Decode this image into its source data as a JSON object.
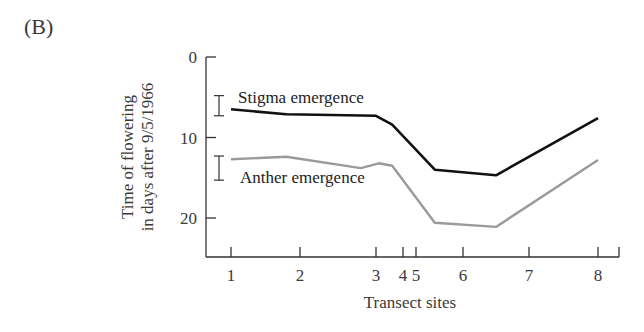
{
  "panel_label": "(B)",
  "chart_data": {
    "type": "line",
    "title": "",
    "xlabel": "Transect sites",
    "ylabel": "Time of flowering in days after 9/5/1966",
    "ylabel_lines": [
      "Time of flowering",
      "in days after 9/5/1966"
    ],
    "y_inverted": true,
    "ylim": [
      0,
      25
    ],
    "yticks": [
      0,
      10,
      20
    ],
    "xticks": [
      1,
      2,
      3,
      4,
      5,
      6,
      7,
      8
    ],
    "xtick_labels": [
      "1",
      "2",
      "3",
      "4",
      "5",
      "6",
      "7",
      "8"
    ],
    "grid": false,
    "legend": "inline labels",
    "series": [
      {
        "name": "Stigma emergence",
        "color": "#111111",
        "x": [
          1.0,
          1.8,
          3.0,
          3.6,
          5.4,
          6.5,
          8.0
        ],
        "values": [
          6.5,
          7.1,
          7.3,
          8.4,
          14.0,
          14.7,
          7.6
        ],
        "error_bar": {
          "center": 6.7,
          "low": 4.8,
          "high": 7.3
        }
      },
      {
        "name": "Anther emergence",
        "color": "#9a9a9a",
        "x": [
          1.0,
          1.8,
          2.8,
          3.1,
          3.6,
          5.4,
          6.5,
          8.0
        ],
        "values": [
          12.7,
          12.4,
          13.8,
          13.2,
          13.5,
          20.6,
          21.1,
          12.8
        ],
        "error_bar": {
          "center": 14.2,
          "low": 12.3,
          "high": 15.3
        }
      }
    ]
  }
}
